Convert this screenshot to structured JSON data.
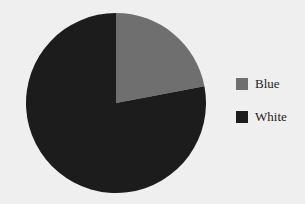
{
  "chart_data": {
    "type": "pie",
    "title": "",
    "categories": [
      "Blue",
      "White"
    ],
    "values": [
      22,
      78
    ],
    "colors": [
      "#6f6f6f",
      "#1c1c1c"
    ],
    "start_angle": "12 o'clock, clockwise",
    "legend_position": "right"
  },
  "legend": {
    "items": [
      {
        "label": "Blue",
        "color": "#6f6f6f"
      },
      {
        "label": "White",
        "color": "#1c1c1c"
      }
    ]
  }
}
